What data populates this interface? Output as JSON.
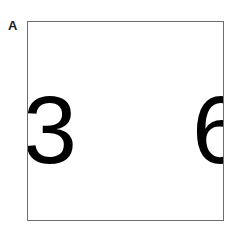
{
  "panel": {
    "label": "A",
    "background_color": "#ffffff"
  },
  "stimulus_box": {
    "border_color": "#6e6e70",
    "fill_color": "#ffffff",
    "border_width_px": 1,
    "left_px": 27,
    "top_px": 21,
    "width_px": 197,
    "height_px": 200
  },
  "stimuli": {
    "digit_color": "#000000",
    "left": {
      "character": "3",
      "position": "left-edge",
      "clipped": "left"
    },
    "right": {
      "character": "6",
      "position": "right-edge",
      "clipped": "right"
    }
  }
}
